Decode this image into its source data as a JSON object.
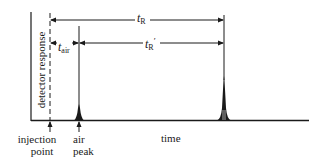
{
  "diagram": {
    "y_axis_label": "detector response",
    "x_axis_label": "time",
    "markers": {
      "injection": {
        "line1": "injection",
        "line2": "point"
      },
      "air_peak": {
        "line1": "air",
        "line2": "peak"
      }
    },
    "intervals": {
      "t_R": {
        "symbol": "t",
        "sub": "R",
        "prime": ""
      },
      "t_R_prime": {
        "symbol": "t",
        "sub": "R",
        "prime": "′"
      },
      "t_air": {
        "symbol": "t",
        "sub": "air",
        "prime": ""
      }
    },
    "colors": {
      "ink": "#1a1a1a",
      "background": "#ffffff"
    }
  }
}
